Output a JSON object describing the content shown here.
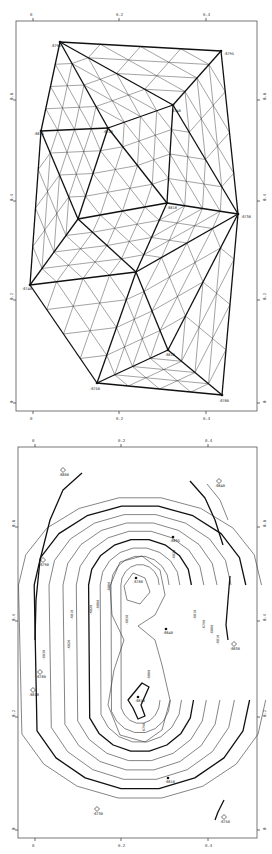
{
  "figure": {
    "panels": [
      {
        "id": "mesh",
        "description": "Triangulated finite-element mesh over control points",
        "x_ticks": [
          "0",
          "0.2",
          "0.4"
        ],
        "y_ticks": [
          "0.6",
          "0.4",
          "0.2",
          "0"
        ],
        "node_labels": [
          "-6790",
          "-6795",
          "-6740",
          "-6720",
          "-6835",
          "-6818",
          "-6730",
          "-6740",
          "-6810",
          "-6750",
          "-6780"
        ]
      },
      {
        "id": "contour",
        "description": "Structure contour map interpolated from the mesh",
        "x_ticks": [
          "0",
          "0.2",
          "0.4"
        ],
        "y_ticks": [
          "0.6",
          "0.4",
          "0.2",
          "0"
        ],
        "well_labels": [
          "-6800",
          "-6840",
          "-6790",
          "-6830",
          "-6818",
          "-6730",
          "-6750",
          "-6780"
        ],
        "control_labels": [
          "-6780",
          "-6835",
          "-6840",
          "-6810",
          "-6810"
        ],
        "contour_labels": [
          "-6800",
          "-6810",
          "-6820",
          "-6830",
          "-6820",
          "-6800",
          "-6810",
          "-6790",
          "-6800",
          "-6810",
          "-6820",
          "-6830",
          "-6800",
          "-6790"
        ]
      }
    ]
  }
}
